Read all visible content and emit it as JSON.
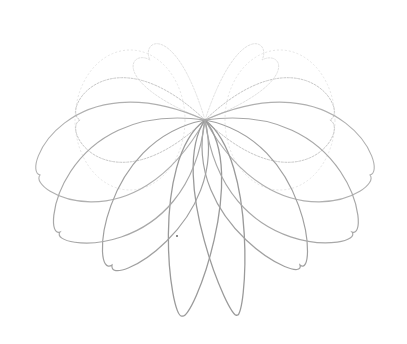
{
  "figure": {
    "title": "",
    "background": "#ffffff",
    "center": [
      205,
      120
    ],
    "loops": [
      {
        "side": "left",
        "tip": [
          182,
          316
        ],
        "ctrl1": [
          150,
          160
        ],
        "ctrl2": [
          170,
          320
        ],
        "shade": "#9a9a9a",
        "width": 1.3,
        "layer": "front"
      },
      {
        "side": "right",
        "tip": [
          237,
          315
        ],
        "ctrl1": [
          258,
          160
        ],
        "ctrl2": [
          246,
          320
        ],
        "shade": "#9a9a9a",
        "width": 1.3,
        "layer": "front"
      },
      {
        "side": "left",
        "tip": [
          112,
          265
        ],
        "ctrl1": [
          100,
          140
        ],
        "ctrl2": [
          90,
          280
        ],
        "shade": "#a0a0a0",
        "width": 1.2,
        "layer": "front"
      },
      {
        "side": "right",
        "tip": [
          300,
          265
        ],
        "ctrl1": [
          310,
          140
        ],
        "ctrl2": [
          318,
          280
        ],
        "shade": "#a0a0a0",
        "width": 1.2,
        "layer": "front"
      },
      {
        "side": "left",
        "tip": [
          60,
          232
        ],
        "ctrl1": [
          60,
          100
        ],
        "ctrl2": [
          40,
          240
        ],
        "shade": "#a8a8a8",
        "width": 1.2,
        "layer": "front"
      },
      {
        "side": "right",
        "tip": [
          352,
          232
        ],
        "ctrl1": [
          350,
          100
        ],
        "ctrl2": [
          372,
          240
        ],
        "shade": "#a8a8a8",
        "width": 1.2,
        "layer": "front"
      },
      {
        "side": "left",
        "tip": [
          40,
          175
        ],
        "ctrl1": [
          70,
          60
        ],
        "ctrl2": [
          20,
          170
        ],
        "shade": "#b0b0b0",
        "width": 1.1,
        "layer": "mid"
      },
      {
        "side": "right",
        "tip": [
          370,
          175
        ],
        "ctrl1": [
          340,
          60
        ],
        "ctrl2": [
          390,
          170
        ],
        "shade": "#b0b0b0",
        "width": 1.1,
        "layer": "mid"
      },
      {
        "side": "left",
        "tip": [
          80,
          120
        ],
        "ctrl1": [
          110,
          30
        ],
        "ctrl2": [
          60,
          110
        ],
        "shade": "#c8c8c8",
        "width": 1.0,
        "layer": "back"
      },
      {
        "side": "right",
        "tip": [
          330,
          120
        ],
        "ctrl1": [
          300,
          30
        ],
        "ctrl2": [
          350,
          110
        ],
        "shade": "#c8c8c8",
        "width": 1.0,
        "layer": "back"
      },
      {
        "side": "left",
        "tip": [
          150,
          60
        ],
        "ctrl1": [
          175,
          20
        ],
        "ctrl2": [
          140,
          40
        ],
        "shade": "#dedede",
        "width": 0.9,
        "layer": "back"
      },
      {
        "side": "right",
        "tip": [
          262,
          60
        ],
        "ctrl1": [
          238,
          20
        ],
        "ctrl2": [
          272,
          40
        ],
        "shade": "#dedede",
        "width": 0.9,
        "layer": "back"
      }
    ],
    "back_rings": [
      {
        "cx": 130,
        "cy": 120,
        "rx": 55,
        "ry": 70,
        "shade": "#e2e2e2"
      },
      {
        "cx": 280,
        "cy": 120,
        "rx": 55,
        "ry": 70,
        "shade": "#e2e2e2"
      }
    ],
    "mark": {
      "x": 177,
      "y": 236,
      "color": "#666666"
    }
  }
}
